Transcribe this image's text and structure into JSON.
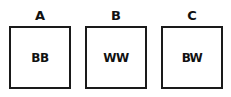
{
  "diagram": {
    "panels": [
      {
        "label": "A",
        "content": "BB"
      },
      {
        "label": "B",
        "content": "WW"
      },
      {
        "label": "C",
        "content": "BW"
      }
    ]
  }
}
